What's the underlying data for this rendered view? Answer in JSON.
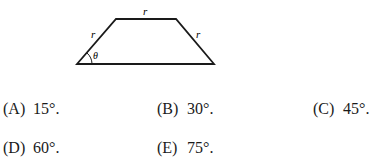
{
  "figure": {
    "shape": "isosceles-trapezoid",
    "labels": {
      "top": "r",
      "left": "r",
      "right": "r",
      "angle": "θ"
    },
    "stroke_color": "#1a1a1a"
  },
  "choices": [
    {
      "label": "(A)",
      "value": "15°."
    },
    {
      "label": "(B)",
      "value": "30°."
    },
    {
      "label": "(C)",
      "value": "45°."
    },
    {
      "label": "(D)",
      "value": "60°."
    },
    {
      "label": "(E)",
      "value": "75°."
    }
  ]
}
